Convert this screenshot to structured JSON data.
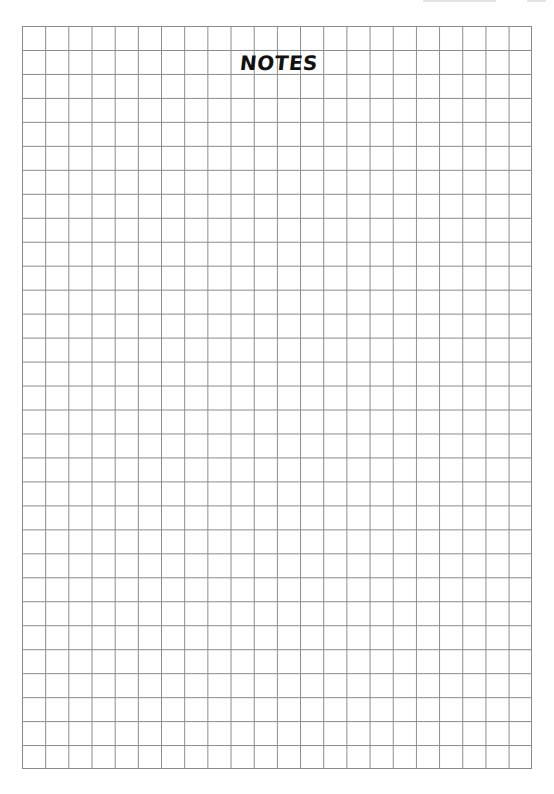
{
  "page": {
    "title": "NOTES",
    "grid": {
      "columns": 22,
      "rows": 31,
      "line_color": "#8a8a8a",
      "background_color": "#ffffff"
    },
    "title_color": "#111111"
  }
}
